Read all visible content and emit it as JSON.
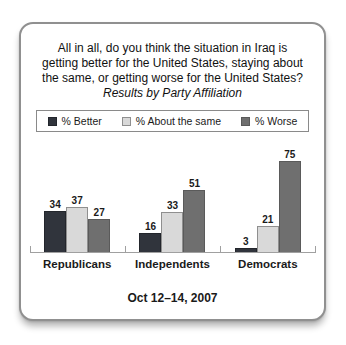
{
  "card": {
    "title_lines": [
      "All in all, do you think the situation in Iraq is",
      "getting better for the United States, staying about",
      "the same, or getting worse for the United States?"
    ],
    "subtitle": "Results by Party Affiliation",
    "date_label": "Oct 12–14, 2007"
  },
  "chart_data": {
    "type": "bar",
    "title": "All in all, do you think the situation in Iraq is getting better for the United States, staying about the same, or getting worse for the United States?",
    "subtitle": "Results by Party Affiliation",
    "categories": [
      "Republicans",
      "Independents",
      "Democrats"
    ],
    "series": [
      {
        "name": "% Better",
        "values": [
          34,
          16,
          3
        ],
        "color": "#30343c",
        "border": "#23262c"
      },
      {
        "name": "% About the same",
        "values": [
          37,
          33,
          21
        ],
        "color": "#d9d9d9",
        "border": "#8f8f8f"
      },
      {
        "name": "% Worse",
        "values": [
          27,
          51,
          75
        ],
        "color": "#6f6f6f",
        "border": "#5a5a5a"
      }
    ],
    "ylim": [
      0,
      80
    ],
    "grid": false,
    "value_labels": true,
    "legend_position": "top",
    "xlabel": "",
    "ylabel": "",
    "date_label": "Oct 12–14, 2007",
    "axis_color": "#a0a0a0"
  }
}
